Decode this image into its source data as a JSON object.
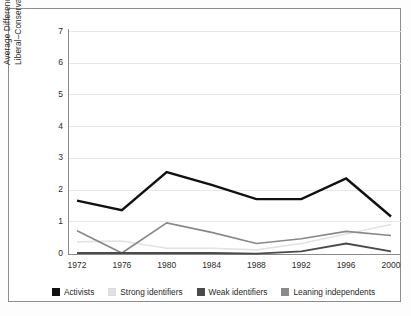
{
  "chart_data": {
    "type": "line",
    "title": "",
    "xlabel": "",
    "ylabel": "Average  Difference on the Liberal–Conservative 7-Point Scale",
    "ylabel_line1": "Average  Difference on the",
    "ylabel_line2": "Liberal–Conservative 7-Point Scale",
    "categories": [
      "1972",
      "1976",
      "1980",
      "1984",
      "1988",
      "1992",
      "1996",
      "2000"
    ],
    "x": [
      1972,
      1976,
      1980,
      1984,
      1988,
      1992,
      1996,
      2000
    ],
    "ylim": [
      0,
      7
    ],
    "yticks": [
      "7",
      "6",
      "5",
      "4",
      "3",
      "2",
      "1",
      "0"
    ],
    "ytick_values": [
      7,
      6,
      5,
      4,
      3,
      2,
      1,
      0
    ],
    "grid": true,
    "grid_axis": "y",
    "legend_position": "bottom",
    "series": [
      {
        "name": "Activists",
        "color": "#111111",
        "width": 2.4,
        "values": [
          1.65,
          1.35,
          2.55,
          2.15,
          1.7,
          1.7,
          2.35,
          1.15
        ]
      },
      {
        "name": "Strong identifiers",
        "color": "#e2e2e2",
        "width": 1.6,
        "values": [
          0.35,
          0.38,
          0.15,
          0.15,
          0.1,
          0.3,
          0.6,
          0.9
        ]
      },
      {
        "name": "Weak identifiers",
        "color": "#4a4a4a",
        "width": 1.8,
        "values": [
          0.0,
          0.0,
          0.0,
          0.0,
          -0.02,
          0.05,
          0.3,
          0.05
        ]
      },
      {
        "name": "Leaning independents",
        "color": "#888888",
        "width": 1.6,
        "values": [
          0.7,
          0.0,
          0.95,
          0.65,
          0.3,
          0.45,
          0.68,
          0.55
        ]
      }
    ]
  },
  "legend": {
    "items": [
      {
        "label": "Activists",
        "color": "#111111"
      },
      {
        "label": "Strong identifiers",
        "color": "#e2e2e2"
      },
      {
        "label": "Weak identifiers",
        "color": "#4a4a4a"
      },
      {
        "label": "Leaning independents",
        "color": "#8b8b8b"
      }
    ]
  },
  "colors": {
    "frame": "#8d8d8d",
    "axis": "#8a8a8a",
    "grid": "#e7e7e7",
    "background": "#ffffff",
    "text": "#2b2b2b"
  }
}
